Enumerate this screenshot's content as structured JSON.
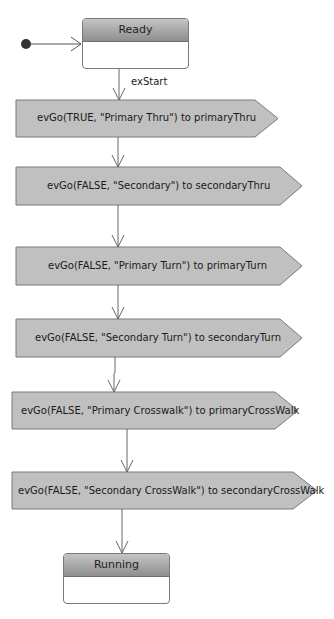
{
  "diagram": {
    "type": "statechart",
    "initial_state": "Ready",
    "states": [
      {
        "name": "Ready"
      },
      {
        "name": "Running"
      }
    ],
    "transitions": [
      {
        "label": "exStart"
      }
    ],
    "actions": [
      {
        "text": "evGo(TRUE, \"Primary Thru\") to primaryThru"
      },
      {
        "text": "evGo(FALSE, \"Secondary\") to secondaryThru"
      },
      {
        "text": "evGo(FALSE, \"Primary Turn\") to primaryTurn"
      },
      {
        "text": "evGo(FALSE, \"Secondary Turn\") to secondaryTurn"
      },
      {
        "text": "evGo(FALSE, \"Primary Crosswalk\") to primaryCrossWalk"
      },
      {
        "text": "evGo(FALSE, \"Secondary CrossWalk\") to secondaryCrossWalk"
      }
    ],
    "colors": {
      "action_fill": "#c0c0c0",
      "action_stroke": "#7a7a7a",
      "header_top": "#c4c4c4",
      "header_bottom": "#8e8e8e",
      "line": "#666666",
      "initial_dot": "#333333"
    }
  }
}
